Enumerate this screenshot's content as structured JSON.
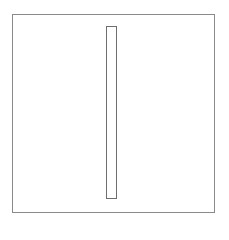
{
  "diagram": {
    "outer_frame": {
      "left": 12,
      "top": 14,
      "width": 203,
      "height": 199,
      "border_color": "#8a8a8a",
      "fill_color": "#ffffff"
    },
    "inner_bar": {
      "left": 106,
      "top": 26,
      "width": 11,
      "height": 173,
      "border_color": "#6e6e6e",
      "fill_color": "#ffffff"
    }
  }
}
